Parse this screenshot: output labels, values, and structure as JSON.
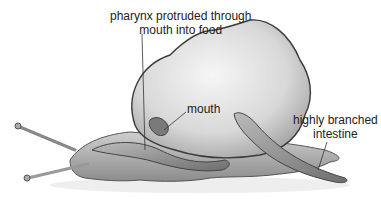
{
  "diagram": {
    "labels": {
      "pharynx_line1": "pharynx protruded through",
      "pharynx_line2": "mouth into food",
      "mouth": "mouth",
      "intestine_line1": "highly branched",
      "intestine_line2": "intestine"
    },
    "colors": {
      "shell": "#dcdcdc",
      "shell_outline": "#3a3a3a",
      "snail_body": "#bdbdbd",
      "worm": "#8a8a8a",
      "text": "#222222"
    }
  }
}
